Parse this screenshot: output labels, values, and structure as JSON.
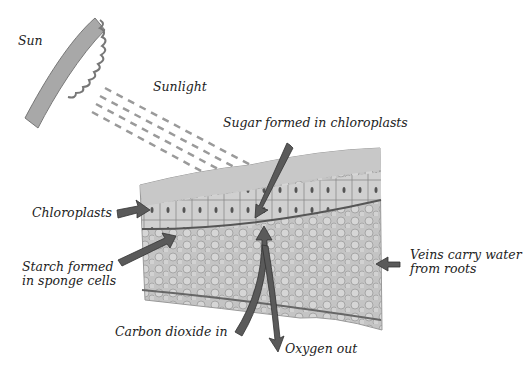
{
  "diagram": {
    "topic": "Photosynthesis in a leaf cross-section",
    "labels": {
      "sun": "Sun",
      "sunlight": "Sunlight",
      "sugar": "Sugar formed in chloroplasts",
      "chloroplasts": "Chloroplasts",
      "starch_line1": "Starch formed",
      "starch_line2": "in sponge cells",
      "veins_line1": "Veins carry water",
      "veins_line2": "from roots",
      "co2": "Carbon dioxide in",
      "oxygen": "Oxygen out"
    },
    "colors": {
      "arrow": "#5a5a5a",
      "tissue": "#b9b9b9",
      "sun": "#9a9a9a"
    }
  }
}
